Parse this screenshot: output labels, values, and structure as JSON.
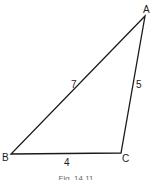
{
  "diagram": {
    "type": "triangle",
    "vertices": {
      "A": {
        "label": "A",
        "x": 145,
        "y": 16
      },
      "B": {
        "label": "B",
        "x": 11,
        "y": 154
      },
      "C": {
        "label": "C",
        "x": 121,
        "y": 153
      }
    },
    "sides": {
      "AB": {
        "label": "7"
      },
      "AC": {
        "label": "5"
      },
      "BC": {
        "label": "4"
      }
    },
    "stroke_color": "#1a1a1a"
  },
  "caption": "Fig. 14.11"
}
